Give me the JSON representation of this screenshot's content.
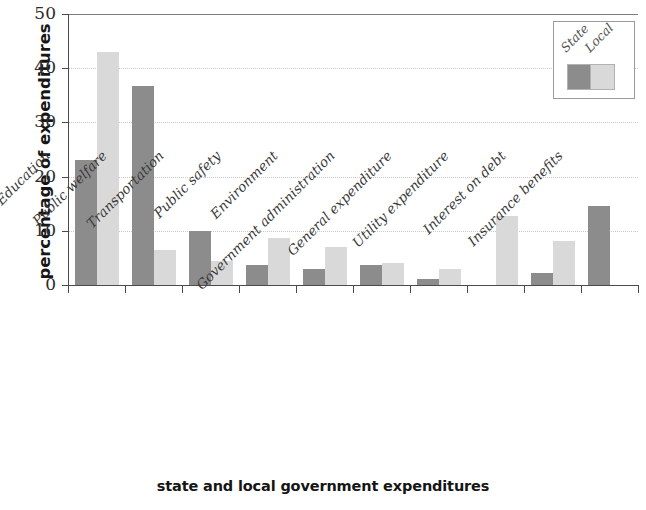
{
  "chart_data": {
    "type": "bar",
    "title": "",
    "xlabel": "state and local government expenditures",
    "ylabel": "percentage of expenditures",
    "ylim": [
      0,
      50
    ],
    "yticks": [
      0,
      10,
      20,
      30,
      40,
      50
    ],
    "grid": true,
    "legend_position": "top-right",
    "categories": [
      "Education",
      "Public welfare",
      "Transportation",
      "Public safety",
      "Environment",
      "Government administration",
      "General expenditure",
      "Utility expenditure",
      "Interest on debt",
      "Insurance benefits"
    ],
    "series": [
      {
        "name": "State",
        "color": "#8c8c8c",
        "values": [
          23,
          36.8,
          10,
          3.7,
          3,
          3.7,
          1.1,
          0,
          2.2,
          14.5
        ]
      },
      {
        "name": "Local",
        "color": "#d9d9d9",
        "values": [
          43,
          6.5,
          4.5,
          8.7,
          7,
          4,
          3,
          12.7,
          8.2,
          0
        ]
      }
    ]
  }
}
